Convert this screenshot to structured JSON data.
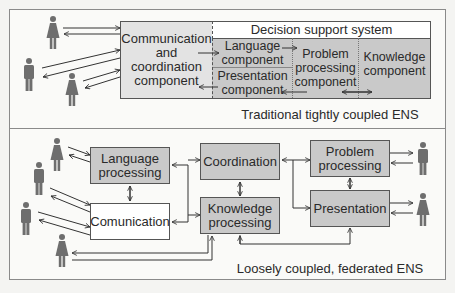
{
  "top_panel": {
    "caption": "Traditional tightly coupled ENS",
    "communication_box": {
      "line1": "Communication",
      "line2": "and",
      "line3": "coordination",
      "line4": "component"
    },
    "dss": {
      "title": "Decision support system",
      "language": {
        "line1": "Language",
        "line2": "component"
      },
      "presentation": {
        "line1": "Presentation",
        "line2": "component"
      },
      "problem": {
        "line1": "Problem",
        "line2": "processing",
        "line3": "component"
      },
      "knowledge": {
        "line1": "Knowledge",
        "line2": "component"
      }
    },
    "users": [
      "woman",
      "man",
      "woman"
    ]
  },
  "bottom_panel": {
    "caption": "Loosely coupled, federated ENS",
    "language": {
      "line1": "Language",
      "line2": "processing"
    },
    "communication": {
      "line1": "Comunication"
    },
    "coordination": {
      "line1": "Coordination"
    },
    "knowledge": {
      "line1": "Knowledge",
      "line2": "processing"
    },
    "problem": {
      "line1": "Problem",
      "line2": "processing"
    },
    "presentation": {
      "line1": "Presentation"
    },
    "users_left": [
      "woman",
      "man",
      "man",
      "woman"
    ],
    "users_right": [
      "man",
      "woman"
    ]
  },
  "colors": {
    "box_dark": "#c9c9c9",
    "box_light": "#e3e3e3",
    "box_white": "#ffffff",
    "person": "#6e6e6e",
    "line": "#333333"
  }
}
